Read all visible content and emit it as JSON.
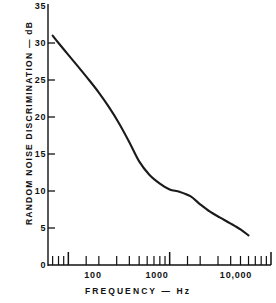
{
  "chart_data": {
    "type": "line",
    "title": "",
    "xlabel": "FREQUENCY — Hz",
    "ylabel": "RANDOM NOISE DISCRIMINATION — dB",
    "xscale": "log",
    "xlim": [
      63,
      10000
    ],
    "ylim": [
      0,
      35
    ],
    "grid": false,
    "legend": null,
    "x_tick_labels": [
      "100",
      "1000",
      "10,000"
    ],
    "x_tick_values": [
      100,
      1000,
      10000
    ],
    "x_minor_ticks": [
      70,
      80,
      90,
      100,
      150,
      200,
      300,
      400,
      500,
      600,
      700,
      800,
      900,
      1000,
      1500,
      2000,
      3000,
      4000,
      5000,
      6000,
      7000,
      8000,
      9000,
      10000
    ],
    "y_tick_labels": [
      "0",
      "5",
      "10",
      "15",
      "20",
      "25",
      "30",
      "35"
    ],
    "y_tick_values": [
      0,
      5,
      10,
      15,
      20,
      25,
      30,
      35
    ],
    "series": [
      {
        "name": "Random noise discrimination",
        "x": [
          70,
          80,
          100,
          125,
          160,
          200,
          250,
          315,
          400,
          500,
          630,
          800,
          1000,
          1250,
          1600,
          2000,
          2500,
          3150,
          4000,
          5000,
          6000
        ],
        "y": [
          31.0,
          30.0,
          28.4,
          26.8,
          25.0,
          23.3,
          21.4,
          19.2,
          16.6,
          14.0,
          12.2,
          11.0,
          10.2,
          9.9,
          9.3,
          8.2,
          7.2,
          6.4,
          5.6,
          4.8,
          4.0
        ]
      }
    ],
    "line_color": "#1a1a1a",
    "axis_color": "#111111",
    "background_color": "#ffffff"
  },
  "axes": {
    "y_axis_title": "RANDOM NOISE DISCRIMINATION — dB",
    "x_axis_title": "FREQUENCY — Hz"
  },
  "y_ticks": [
    {
      "label": "35",
      "value": 35
    },
    {
      "label": "30",
      "value": 30
    },
    {
      "label": "25",
      "value": 25
    },
    {
      "label": "20",
      "value": 20
    },
    {
      "label": "15",
      "value": 15
    },
    {
      "label": "10",
      "value": 10
    },
    {
      "label": "5",
      "value": 5
    },
    {
      "label": "0",
      "value": 0
    }
  ],
  "x_ticks": [
    {
      "label": "100",
      "value": 100
    },
    {
      "label": "1000",
      "value": 1000
    },
    {
      "label": "10,000",
      "value": 10000
    }
  ]
}
